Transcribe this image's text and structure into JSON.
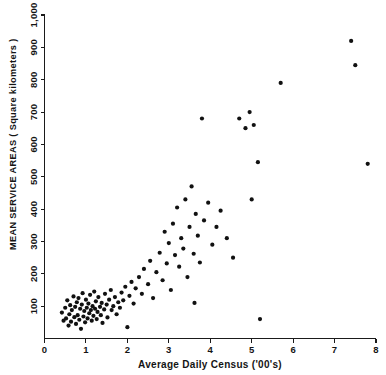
{
  "chart_data": {
    "type": "scatter",
    "title": "",
    "xlabel": "Average Daily Census ('00's)",
    "ylabel": "MEAN SERVICE AREAS ( Square kilometers )",
    "xlim": [
      0,
      8
    ],
    "ylim": [
      0,
      1000
    ],
    "xticks": [
      0,
      1,
      2,
      3,
      4,
      5,
      6,
      7,
      8
    ],
    "xticklabels": [
      "0",
      "1",
      "2",
      "3",
      "4",
      "5",
      "6",
      "7",
      "8"
    ],
    "yticks": [
      100,
      200,
      300,
      400,
      500,
      600,
      700,
      800,
      900,
      1000
    ],
    "yticklabels": [
      "100",
      "200",
      "300",
      "400",
      "500",
      "600",
      "700",
      "800",
      "900",
      "1,000"
    ],
    "grid": false,
    "legend": null,
    "marker": "filled-circle",
    "marker_color": "#111111",
    "points": [
      [
        0.42,
        80
      ],
      [
        0.46,
        55
      ],
      [
        0.5,
        95
      ],
      [
        0.52,
        62
      ],
      [
        0.55,
        118
      ],
      [
        0.58,
        40
      ],
      [
        0.6,
        75
      ],
      [
        0.62,
        103
      ],
      [
        0.64,
        52
      ],
      [
        0.66,
        88
      ],
      [
        0.7,
        130
      ],
      [
        0.72,
        66
      ],
      [
        0.74,
        98
      ],
      [
        0.76,
        45
      ],
      [
        0.78,
        112
      ],
      [
        0.8,
        72
      ],
      [
        0.82,
        125
      ],
      [
        0.84,
        58
      ],
      [
        0.86,
        92
      ],
      [
        0.88,
        30
      ],
      [
        0.9,
        105
      ],
      [
        0.92,
        140
      ],
      [
        0.94,
        68
      ],
      [
        0.96,
        85
      ],
      [
        0.98,
        50
      ],
      [
        1.0,
        120
      ],
      [
        1.02,
        95
      ],
      [
        1.04,
        62
      ],
      [
        1.06,
        108
      ],
      [
        1.08,
        78
      ],
      [
        1.1,
        135
      ],
      [
        1.12,
        88
      ],
      [
        1.14,
        55
      ],
      [
        1.16,
        100
      ],
      [
        1.18,
        70
      ],
      [
        1.2,
        145
      ],
      [
        1.22,
        92
      ],
      [
        1.24,
        115
      ],
      [
        1.26,
        60
      ],
      [
        1.28,
        82
      ],
      [
        1.3,
        128
      ],
      [
        1.34,
        98
      ],
      [
        1.36,
        72
      ],
      [
        1.38,
        110
      ],
      [
        1.4,
        48
      ],
      [
        1.44,
        90
      ],
      [
        1.46,
        138
      ],
      [
        1.5,
        105
      ],
      [
        1.52,
        65
      ],
      [
        1.56,
        120
      ],
      [
        1.6,
        150
      ],
      [
        1.62,
        88
      ],
      [
        1.66,
        100
      ],
      [
        1.7,
        128
      ],
      [
        1.74,
        75
      ],
      [
        1.78,
        112
      ],
      [
        1.82,
        95
      ],
      [
        1.86,
        142
      ],
      [
        1.9,
        118
      ],
      [
        1.95,
        160
      ],
      [
        2.0,
        35
      ],
      [
        2.05,
        132
      ],
      [
        2.1,
        175
      ],
      [
        2.15,
        108
      ],
      [
        2.2,
        155
      ],
      [
        2.28,
        190
      ],
      [
        2.35,
        138
      ],
      [
        2.4,
        215
      ],
      [
        2.5,
        168
      ],
      [
        2.55,
        240
      ],
      [
        2.62,
        125
      ],
      [
        2.7,
        205
      ],
      [
        2.78,
        265
      ],
      [
        2.85,
        180
      ],
      [
        2.9,
        330
      ],
      [
        2.95,
        232
      ],
      [
        3.0,
        295
      ],
      [
        3.05,
        150
      ],
      [
        3.1,
        355
      ],
      [
        3.15,
        258
      ],
      [
        3.2,
        405
      ],
      [
        3.25,
        222
      ],
      [
        3.3,
        310
      ],
      [
        3.35,
        278
      ],
      [
        3.4,
        430
      ],
      [
        3.45,
        190
      ],
      [
        3.5,
        345
      ],
      [
        3.55,
        470
      ],
      [
        3.6,
        262
      ],
      [
        3.62,
        110
      ],
      [
        3.65,
        385
      ],
      [
        3.7,
        318
      ],
      [
        3.75,
        235
      ],
      [
        3.8,
        680
      ],
      [
        3.85,
        365
      ],
      [
        3.95,
        420
      ],
      [
        4.05,
        290
      ],
      [
        4.15,
        345
      ],
      [
        4.25,
        395
      ],
      [
        4.4,
        310
      ],
      [
        4.55,
        250
      ],
      [
        4.7,
        680
      ],
      [
        4.85,
        650
      ],
      [
        4.95,
        700
      ],
      [
        5.0,
        430
      ],
      [
        5.05,
        660
      ],
      [
        5.15,
        545
      ],
      [
        5.2,
        60
      ],
      [
        5.7,
        790
      ],
      [
        7.4,
        920
      ],
      [
        7.5,
        845
      ],
      [
        7.8,
        540
      ]
    ]
  }
}
